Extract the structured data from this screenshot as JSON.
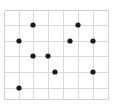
{
  "figure": {
    "background_color": "#ffffff",
    "width": 113,
    "height": 108
  },
  "chart_data": {
    "type": "scatter",
    "title": "",
    "subtitle": "",
    "xlabel": "",
    "ylabel": "",
    "grid": true,
    "legend": null,
    "legend_position": "none",
    "xlim": [
      4,
      108
    ],
    "ylim": [
      10,
      99
    ],
    "x_tick_labels": [],
    "y_tick_labels": [],
    "x_gridlines": [
      4,
      19,
      33,
      48,
      63,
      78,
      93,
      108
    ],
    "y_gridlines": [
      10,
      25,
      41,
      56,
      72,
      88,
      99
    ],
    "marker": {
      "shape": "circle",
      "color": "#1b1b1b",
      "radius": 2.6
    },
    "grid_color": "#d9d9d9",
    "border_color": "#cfcfcf",
    "point_count": 10,
    "points": [
      {
        "x": 33,
        "y": 25
      },
      {
        "x": 78,
        "y": 25
      },
      {
        "x": 19,
        "y": 41
      },
      {
        "x": 70,
        "y": 41
      },
      {
        "x": 93,
        "y": 41
      },
      {
        "x": 33,
        "y": 56
      },
      {
        "x": 48,
        "y": 56
      },
      {
        "x": 55,
        "y": 72
      },
      {
        "x": 93,
        "y": 72
      },
      {
        "x": 19,
        "y": 88
      }
    ]
  }
}
